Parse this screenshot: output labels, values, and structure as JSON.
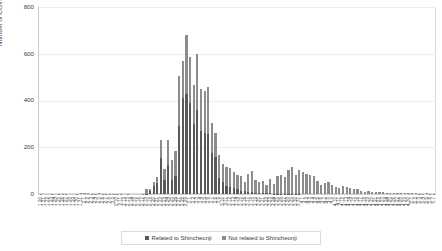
{
  "chart_data": {
    "type": "bar",
    "title": "",
    "subtitle": "",
    "xlabel": "",
    "ylabel": "Number of COVID-19 cases",
    "ylim": [
      0,
      800
    ],
    "yticks": [
      0,
      200,
      400,
      600,
      800
    ],
    "grid": true,
    "stacked": true,
    "legend_position": "bottom",
    "legend": [
      "Related to Shincheonji",
      "Not related to Shincheonji"
    ],
    "colors": {
      "related": "#595959",
      "not_related": "#8c8c8c",
      "gridline": "#eeeeee",
      "axis": "#c8c8c8",
      "text": "#404040"
    },
    "categories": [
      "1.20",
      "1.21",
      "1.22",
      "1.23",
      "1.24",
      "1.25",
      "1.26",
      "1.27",
      "1.28",
      "1.29",
      "1.30",
      "1.31",
      "2.1",
      "2.2",
      "2.3",
      "2.4",
      "2.5",
      "2.6",
      "2.7",
      "2.8",
      "2.9",
      "2.10",
      "2.11",
      "2.12",
      "2.13",
      "2.14",
      "2.15",
      "2.16",
      "2.17",
      "2.18",
      "2.19",
      "2.20",
      "2.21",
      "2.22",
      "2.23",
      "2.24",
      "2.25",
      "2.26",
      "2.27",
      "2.28",
      "2.29",
      "3.1",
      "3.2",
      "3.3",
      "3.4",
      "3.5",
      "3.6",
      "3.7",
      "3.8",
      "3.9",
      "3.10",
      "3.11",
      "3.12",
      "3.13",
      "3.14",
      "3.15",
      "3.16",
      "3.17",
      "3.18",
      "3.19",
      "3.20",
      "3.21",
      "3.22",
      "3.23",
      "3.24",
      "3.25",
      "3.26",
      "3.27",
      "3.28",
      "3.29",
      "3.30",
      "3.31",
      "4.1",
      "4.2",
      "4.3",
      "4.4",
      "4.5",
      "4.6",
      "4.7",
      "4.8",
      "4.9",
      "4.10",
      "4.11",
      "4.12",
      "4.13",
      "4.14",
      "4.15",
      "4.16",
      "4.17",
      "4.18",
      "4.19",
      "4.20",
      "4.21",
      "4.22",
      "4.23",
      "4.24",
      "4.25",
      "4.26",
      "4.27",
      "4.28",
      "4.29",
      "4.30",
      "5.1",
      "5.2",
      "5.3",
      "5.4",
      "5.5",
      "5.6",
      "5.7"
    ],
    "series": [
      {
        "name": "Related to Shincheonji",
        "color": "#595959",
        "values": [
          0,
          0,
          0,
          0,
          0,
          0,
          0,
          0,
          0,
          0,
          0,
          0,
          0,
          0,
          0,
          0,
          0,
          0,
          0,
          0,
          0,
          0,
          0,
          0,
          0,
          0,
          0,
          0,
          0,
          1,
          15,
          35,
          45,
          155,
          60,
          125,
          60,
          75,
          290,
          410,
          430,
          390,
          300,
          360,
          270,
          260,
          255,
          175,
          160,
          70,
          50,
          35,
          30,
          25,
          20,
          15,
          12,
          10,
          8,
          6,
          5,
          4,
          3,
          3,
          2,
          2,
          2,
          1,
          1,
          1,
          1,
          1,
          0,
          0,
          0,
          0,
          0,
          0,
          0,
          0,
          0,
          0,
          0,
          0,
          0,
          0,
          0,
          0,
          0,
          0,
          0,
          0,
          0,
          0,
          0,
          0,
          0,
          0,
          0,
          0,
          0,
          0,
          0,
          0,
          0,
          0,
          0,
          0,
          0
        ]
      },
      {
        "name": "Not related to Shincheonji",
        "color": "#8c8c8c",
        "values": [
          1,
          0,
          0,
          1,
          0,
          1,
          1,
          1,
          0,
          0,
          1,
          3,
          3,
          3,
          1,
          1,
          3,
          2,
          1,
          1,
          1,
          1,
          2,
          0,
          2,
          0,
          0,
          0,
          2,
          19,
          5,
          18,
          29,
          74,
          45,
          106,
          84,
          110,
          215,
          160,
          250,
          195,
          165,
          240,
          180,
          180,
          205,
          130,
          100,
          95,
          80,
          80,
          80,
          70,
          60,
          60,
          40,
          75,
          90,
          55,
          45,
          50,
          35,
          60,
          40,
          75,
          80,
          70,
          100,
          115,
          80,
          100,
          95,
          85,
          80,
          75,
          55,
          40,
          45,
          50,
          40,
          30,
          25,
          35,
          30,
          25,
          20,
          20,
          15,
          10,
          12,
          8,
          10,
          8,
          7,
          6,
          6,
          5,
          4,
          3,
          3,
          4,
          4,
          3,
          2,
          2,
          3,
          2,
          2
        ]
      }
    ]
  }
}
